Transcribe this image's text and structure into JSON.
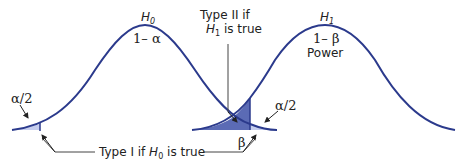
{
  "diagram": {
    "type": "hypothesis-testing-error-diagram",
    "colors": {
      "curve": "#2b3a8c",
      "beta_fill": "#5b6bb5",
      "alpha_fill": "#c5cdee",
      "text": "#222222"
    },
    "curves": [
      {
        "id": "H0",
        "label_main": "H",
        "label_sub": "0",
        "region_label": "1– α"
      },
      {
        "id": "H1",
        "label_main": "H",
        "label_sub": "1",
        "region_label": "1– β",
        "region_label_2": "Power"
      }
    ],
    "annotations": {
      "alpha_left": "α/2",
      "alpha_right": "α/2",
      "beta": "β",
      "type2_line1": "Type II if",
      "type2_line2_main": "H",
      "type2_line2_sub": "1",
      "type2_line2_rest": " is true",
      "type1_prefix": "Type I if ",
      "type1_main": "H",
      "type1_sub": "0",
      "type1_rest": " is true"
    }
  }
}
